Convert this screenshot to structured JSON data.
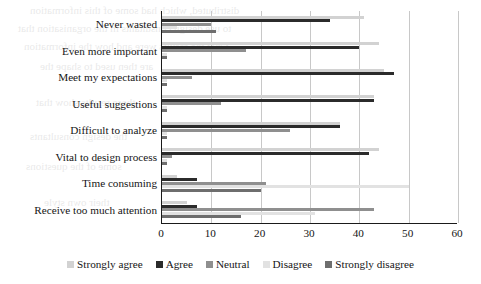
{
  "chart_data": {
    "type": "bar",
    "orientation": "horizontal",
    "title": "",
    "xlabel": "",
    "ylabel": "",
    "xlim": [
      0,
      60
    ],
    "xticks": [
      0,
      10,
      20,
      30,
      40,
      50,
      60
    ],
    "grid": true,
    "legend_position": "bottom",
    "categories": [
      "Never wasted",
      "Even more important",
      "Meet my expectations",
      "Useful suggestions",
      "Difficult to analyze",
      "Vital to design process",
      "Time consuming",
      "Receive too much attention"
    ],
    "series": [
      {
        "name": "Strongly agree",
        "color": "#d2d2d2",
        "values": [
          41,
          44,
          45,
          43,
          36,
          44,
          3,
          5
        ]
      },
      {
        "name": "Agree",
        "color": "#2b2b2b",
        "values": [
          34,
          40,
          47,
          43,
          36,
          42,
          7,
          7
        ]
      },
      {
        "name": "Neutral",
        "color": "#8f8f8f",
        "values": [
          10,
          17,
          6,
          12,
          26,
          2,
          21,
          43
        ]
      },
      {
        "name": "Disagree",
        "color": "#e2e2e2",
        "values": [
          3,
          1,
          1,
          1,
          1,
          1,
          50,
          31
        ]
      },
      {
        "name": "Strongly disagree",
        "color": "#6e6e6e",
        "values": [
          11,
          1,
          1,
          1,
          1,
          1,
          20,
          16
        ]
      }
    ]
  },
  "ghost_text": [
    "distributed, which had some of this information",
    "to use design consultants in the organisation that",
    "what the results were and how the information",
    "are then used to shape the",
    "these results show that",
    "the design consultants",
    "some of the questions",
    "their own style"
  ]
}
